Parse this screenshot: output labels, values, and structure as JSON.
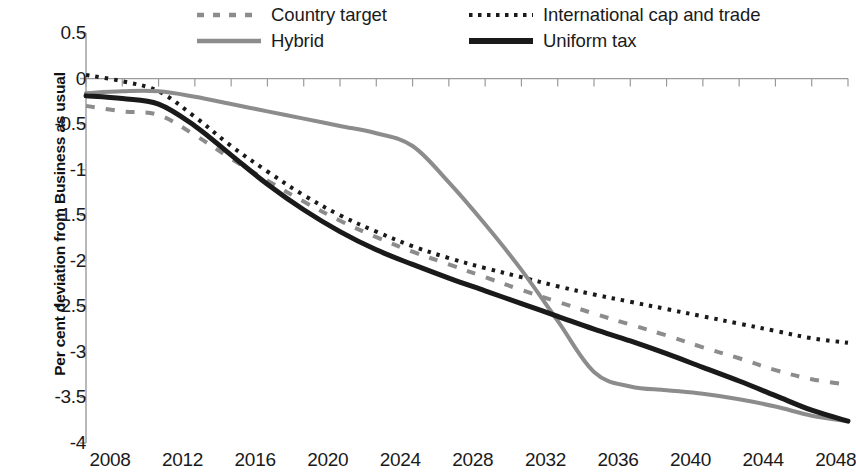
{
  "chart_data": {
    "type": "line",
    "title": "",
    "xlabel": "",
    "ylabel": "Per cent deviation from Business as usual",
    "xlim": [
      2008,
      2050
    ],
    "ylim": [
      -4,
      0.5
    ],
    "ytick_labels": [
      "0.5",
      "0",
      "-0.5",
      "-1",
      "-1.5",
      "-2",
      "-2.5",
      "-3",
      "-3.5",
      "-4"
    ],
    "ytick_values": [
      0.5,
      0,
      -0.5,
      -1,
      -1.5,
      -2,
      -2.5,
      -3,
      -3.5,
      -4
    ],
    "xtick_labels": [
      "2008",
      "2012",
      "2016",
      "2020",
      "2024",
      "2028",
      "2032",
      "2036",
      "2040",
      "2044",
      "2048"
    ],
    "xtick_values": [
      2008,
      2012,
      2016,
      2020,
      2024,
      2028,
      2032,
      2036,
      2040,
      2044,
      2048
    ],
    "minor_tick_interval": 2,
    "grid": false,
    "zero_line": true,
    "legend_position": "top",
    "x": [
      2008,
      2010,
      2012,
      2014,
      2016,
      2018,
      2020,
      2022,
      2024,
      2026,
      2028,
      2030,
      2032,
      2034,
      2036,
      2038,
      2040,
      2042,
      2044,
      2046,
      2048,
      2050
    ],
    "series": [
      {
        "name": "Country target",
        "style": "dashed",
        "color": "#8c8c8c",
        "width": 4,
        "values": [
          -0.3,
          -0.36,
          -0.4,
          -0.62,
          -0.88,
          -1.12,
          -1.35,
          -1.56,
          -1.74,
          -1.9,
          -2.04,
          -2.18,
          -2.32,
          -2.45,
          -2.58,
          -2.7,
          -2.82,
          -2.95,
          -3.07,
          -3.2,
          -3.3,
          -3.36
        ]
      },
      {
        "name": "International cap and trade",
        "style": "dotted",
        "color": "#1a1a1a",
        "width": 4,
        "values": [
          0.04,
          -0.03,
          -0.14,
          -0.42,
          -0.74,
          -1.02,
          -1.28,
          -1.5,
          -1.68,
          -1.84,
          -1.97,
          -2.08,
          -2.18,
          -2.28,
          -2.37,
          -2.45,
          -2.53,
          -2.61,
          -2.69,
          -2.77,
          -2.85,
          -2.9
        ]
      },
      {
        "name": "Hybrid",
        "style": "solid",
        "color": "#8c8c8c",
        "width": 4,
        "values": [
          -0.16,
          -0.14,
          -0.14,
          -0.2,
          -0.28,
          -0.36,
          -0.44,
          -0.52,
          -0.6,
          -0.74,
          -1.14,
          -1.6,
          -2.1,
          -2.66,
          -3.22,
          -3.38,
          -3.42,
          -3.46,
          -3.52,
          -3.6,
          -3.7,
          -3.76
        ]
      },
      {
        "name": "Uniform tax",
        "style": "solid",
        "color": "#1a1a1a",
        "width": 5,
        "values": [
          -0.19,
          -0.22,
          -0.28,
          -0.52,
          -0.84,
          -1.16,
          -1.44,
          -1.68,
          -1.88,
          -2.04,
          -2.19,
          -2.33,
          -2.47,
          -2.61,
          -2.75,
          -2.88,
          -3.02,
          -3.17,
          -3.32,
          -3.48,
          -3.64,
          -3.76
        ]
      }
    ]
  },
  "legend": {
    "items": [
      {
        "label": "Country target",
        "swatch": "dashed-gray-line-swatch"
      },
      {
        "label": "International cap and trade",
        "swatch": "dotted-black-line-swatch"
      },
      {
        "label": "Hybrid",
        "swatch": "solid-gray-line-swatch"
      },
      {
        "label": "Uniform tax",
        "swatch": "solid-black-line-swatch"
      }
    ]
  },
  "colors": {
    "gray_series": "#8c8c8c",
    "black_series": "#1a1a1a",
    "axis": "#9a9a9a",
    "text": "#1a1a1a",
    "background": "#ffffff"
  }
}
